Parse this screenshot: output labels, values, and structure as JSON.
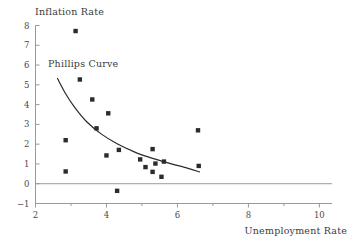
{
  "chart_data": {
    "type": "scatter",
    "title": "",
    "xlabel": "Unemployment Rate",
    "ylabel": "Inflation Rate",
    "xlim": [
      2,
      10.3
    ],
    "ylim": [
      -1,
      8
    ],
    "xticks": [
      2,
      4,
      6,
      8,
      10
    ],
    "xticks_minor": [
      3,
      5,
      7,
      9
    ],
    "yticks": [
      -1,
      0,
      1,
      2,
      3,
      4,
      5,
      6,
      7,
      8
    ],
    "grid": false,
    "legend": "none",
    "zero_line": true,
    "annotations": [
      {
        "text": "Phillips Curve",
        "x": 2.35,
        "y": 6.1
      }
    ],
    "marker": {
      "shape": "square",
      "color": "#2b2b2b",
      "size": 4.4
    },
    "points": [
      {
        "x": 2.85,
        "y": 2.2
      },
      {
        "x": 2.85,
        "y": 0.62
      },
      {
        "x": 3.13,
        "y": 7.72
      },
      {
        "x": 3.25,
        "y": 5.27
      },
      {
        "x": 3.6,
        "y": 4.26
      },
      {
        "x": 3.72,
        "y": 2.8
      },
      {
        "x": 4.0,
        "y": 1.43
      },
      {
        "x": 4.05,
        "y": 3.56
      },
      {
        "x": 4.3,
        "y": -0.36
      },
      {
        "x": 4.35,
        "y": 1.71
      },
      {
        "x": 4.95,
        "y": 1.23
      },
      {
        "x": 5.1,
        "y": 0.84
      },
      {
        "x": 5.3,
        "y": 1.75
      },
      {
        "x": 5.3,
        "y": 0.6
      },
      {
        "x": 5.38,
        "y": 1.02
      },
      {
        "x": 5.55,
        "y": 0.35
      },
      {
        "x": 5.62,
        "y": 1.12
      },
      {
        "x": 6.58,
        "y": 2.7
      },
      {
        "x": 6.6,
        "y": 0.9
      }
    ],
    "fit_curve": {
      "name": "Phillips Curve",
      "color": "#2b2b2b",
      "points": [
        {
          "x": 2.62,
          "y": 5.32
        },
        {
          "x": 2.85,
          "y": 4.55
        },
        {
          "x": 3.12,
          "y": 3.82
        },
        {
          "x": 3.45,
          "y": 3.12
        },
        {
          "x": 3.85,
          "y": 2.52
        },
        {
          "x": 4.3,
          "y": 2.02
        },
        {
          "x": 4.8,
          "y": 1.6
        },
        {
          "x": 5.3,
          "y": 1.28
        },
        {
          "x": 5.8,
          "y": 1.02
        },
        {
          "x": 6.3,
          "y": 0.78
        },
        {
          "x": 6.62,
          "y": 0.6
        }
      ]
    }
  },
  "axis_titles": {
    "y": "Inflation Rate",
    "x": "Unemployment Rate"
  },
  "annotation_label": "Phillips Curve",
  "colors": {
    "marker": "#2b2b2b",
    "curve": "#2b2b2b",
    "axis": "#999999",
    "zero_line": "#9a9a9a",
    "text": "#3c3c3c"
  }
}
